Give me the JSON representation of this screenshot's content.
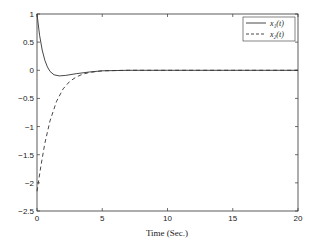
{
  "chart_data": {
    "type": "line",
    "title": "",
    "xlabel": "Time (Sec.)",
    "ylabel": "",
    "xlim": [
      0,
      20
    ],
    "ylim": [
      -2.5,
      1
    ],
    "xticks": [
      "0",
      "5",
      "10",
      "15",
      "20"
    ],
    "yticks": [
      "1",
      "0.5",
      "0",
      "-0.5",
      "-1",
      "-1.5",
      "-2",
      "-2.5"
    ],
    "grid": false,
    "legend_position": "upper right",
    "series": [
      {
        "name": "x1(t)",
        "style": "solid",
        "x": [
          0,
          0.2,
          0.4,
          0.6,
          0.8,
          1.0,
          1.3,
          1.7,
          2.2,
          3,
          4,
          5,
          7,
          10,
          15,
          20
        ],
        "y": [
          1.0,
          0.62,
          0.36,
          0.18,
          0.06,
          -0.02,
          -0.08,
          -0.1,
          -0.09,
          -0.06,
          -0.03,
          -0.01,
          0,
          0,
          0,
          0
        ]
      },
      {
        "name": "x2(t)",
        "style": "dashed",
        "x": [
          0,
          0.3,
          0.6,
          1.0,
          1.5,
          2.0,
          2.5,
          3,
          3.5,
          4,
          5,
          7,
          10,
          15,
          20
        ],
        "y": [
          -2.15,
          -1.7,
          -1.3,
          -0.9,
          -0.55,
          -0.33,
          -0.2,
          -0.12,
          -0.07,
          -0.04,
          -0.01,
          0,
          0,
          0,
          0
        ]
      }
    ]
  },
  "legend": {
    "items": [
      "x₁(t)",
      "x₂(t)"
    ]
  }
}
